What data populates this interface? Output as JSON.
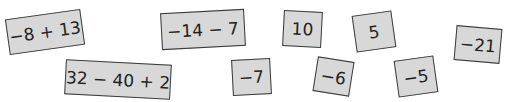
{
  "cards": [
    {
      "text": "−8 + 13"
    },
    {
      "text": "32 − 40 + 2"
    },
    {
      "text": "−14 − 7"
    },
    {
      "text": "10"
    },
    {
      "text": "−7"
    },
    {
      "text": "−6"
    },
    {
      "text": "5"
    },
    {
      "text": "−5"
    },
    {
      "text": "−21"
    }
  ],
  "colors": {
    "card_fill": "#d8d8d8",
    "card_border": "#3a3a3a",
    "text": "#222222"
  }
}
